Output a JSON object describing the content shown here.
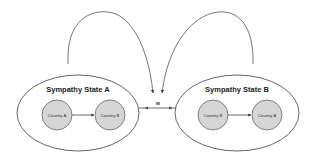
{
  "diagram": {
    "colors": {
      "stroke": "#555555",
      "node_fill": "#d6d6d6",
      "ellipse_fill": "#ffffff",
      "background": "#ffffff"
    },
    "states": [
      {
        "title": "Sympathy State A",
        "nodes": [
          {
            "label": "Country A"
          },
          {
            "label": "Country B"
          }
        ]
      },
      {
        "title": "Sympathy State B",
        "nodes": [
          {
            "label": "Country B"
          },
          {
            "label": "Country A"
          }
        ]
      }
    ],
    "transition_label": "w"
  }
}
